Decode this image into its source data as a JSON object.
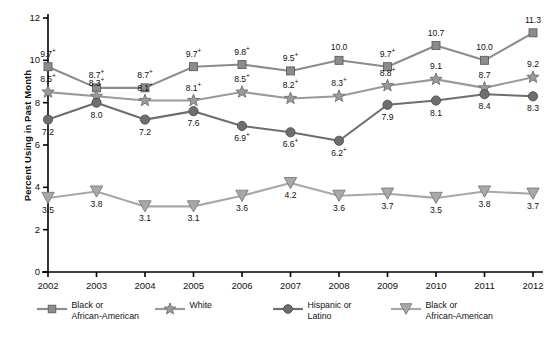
{
  "chart_data": {
    "type": "line",
    "title": "",
    "xlabel": "",
    "ylabel": "Percent Using in Past Month",
    "categories": [
      "2002",
      "2003",
      "2004",
      "2005",
      "2006",
      "2007",
      "2008",
      "2009",
      "2010",
      "2011",
      "2012"
    ],
    "ylim": [
      0,
      12
    ],
    "yticks": [
      0,
      2,
      4,
      6,
      8,
      10,
      12
    ],
    "grid": false,
    "legend_position": "bottom",
    "series": [
      {
        "name": "Black or African-American",
        "marker": "square",
        "color": "#8c8c8c",
        "values": [
          9.7,
          8.7,
          8.7,
          9.7,
          9.8,
          9.5,
          10.0,
          9.7,
          10.7,
          10.0,
          11.3
        ],
        "labels": [
          "9.7+",
          "8.7+",
          "8.7+",
          "9.7+",
          "9.8+",
          "9.5+",
          "10.0",
          "9.7+",
          "10.7",
          "10.0",
          "11.3"
        ]
      },
      {
        "name": "White",
        "marker": "star",
        "color": "#9a9a9a",
        "values": [
          8.5,
          8.3,
          8.1,
          8.1,
          8.5,
          8.2,
          8.3,
          8.8,
          9.1,
          8.7,
          9.2
        ],
        "labels": [
          "8.5+",
          "8.3+",
          "8.1+",
          "8.1+",
          "8.5+",
          "8.2+",
          "8.3+",
          "8.8+",
          "9.1",
          "8.7",
          "9.2"
        ]
      },
      {
        "name": "Hispanic or Latino",
        "marker": "circle",
        "color": "#6e6e6e",
        "values": [
          7.2,
          8.0,
          7.2,
          7.6,
          6.9,
          6.6,
          6.2,
          7.9,
          8.1,
          8.4,
          8.3
        ],
        "labels": [
          "7.2",
          "8.0",
          "7.2",
          "7.6",
          "6.9+",
          "6.6+",
          "6.2+",
          "7.9",
          "8.1",
          "8.4",
          "8.3"
        ]
      },
      {
        "name": "Black or African-American",
        "marker": "triangle-down",
        "color": "#a8a8a8",
        "values": [
          3.5,
          3.8,
          3.1,
          3.1,
          3.6,
          4.2,
          3.6,
          3.7,
          3.5,
          3.8,
          3.7
        ],
        "labels": [
          "3.5",
          "3.8",
          "3.1",
          "3.1",
          "3.6",
          "4.2",
          "3.6",
          "3.7",
          "3.5",
          "3.8",
          "3.7"
        ]
      }
    ]
  },
  "axis": {
    "y_label": "Percent Using in Past Month",
    "y_ticks": [
      "0",
      "2",
      "4",
      "6",
      "8",
      "10",
      "12"
    ],
    "x_ticks": [
      "2002",
      "2003",
      "2004",
      "2005",
      "2006",
      "2007",
      "2008",
      "2009",
      "2010",
      "2011",
      "2012"
    ]
  },
  "legend": {
    "items": [
      {
        "label": "Black or\nAfrican-American",
        "marker": "square",
        "color": "#8c8c8c"
      },
      {
        "label": "White",
        "marker": "star",
        "color": "#9a9a9a"
      },
      {
        "label": "Hispanic or\nLatino",
        "marker": "circle",
        "color": "#6e6e6e"
      },
      {
        "label": "Black or\nAfrican-American",
        "marker": "triangle-down",
        "color": "#a8a8a8"
      }
    ]
  },
  "colors": {
    "axis": "#000000",
    "text": "#111111",
    "background": "#ffffff"
  }
}
